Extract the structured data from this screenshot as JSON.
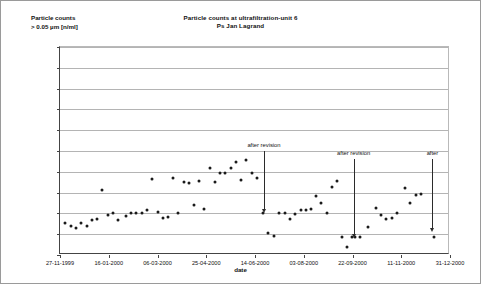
{
  "chart_data": {
    "type": "scatter",
    "title": "Particle counts at ultrafiltration-unit 6",
    "subtitle": "Ps Jan Lagrand",
    "ylabel_line1": "Particle counts",
    "ylabel_line2": "> 0.05 µm [n/ml]",
    "xlabel": "date",
    "ylim": [
      0,
      5000
    ],
    "ytick_labels": [
      "0",
      "500",
      "1,000",
      "1,500",
      "2,000",
      "2,500",
      "3,000",
      "3,500",
      "4,000",
      "4,500",
      "5,000"
    ],
    "ytick_values": [
      0,
      500,
      1000,
      1500,
      2000,
      2500,
      3000,
      3500,
      4000,
      4500,
      5000
    ],
    "xtick_labels": [
      "27-11-1999",
      "16-01-2000",
      "06-03-2000",
      "25-04-2000",
      "14-06-2000",
      "03-08-2000",
      "22-09-2000",
      "11-11-2000",
      "31-12-2000"
    ],
    "xtick_positions": [
      0,
      0.125,
      0.25,
      0.375,
      0.5,
      0.625,
      0.75,
      0.875,
      1.0
    ],
    "grid": true,
    "legend": null,
    "marker_color": "#1a1a1a",
    "series": [
      {
        "name": "particle counts",
        "points": [
          {
            "x": 0.012,
            "y": 760
          },
          {
            "x": 0.028,
            "y": 700
          },
          {
            "x": 0.041,
            "y": 640
          },
          {
            "x": 0.055,
            "y": 760
          },
          {
            "x": 0.069,
            "y": 690
          },
          {
            "x": 0.082,
            "y": 830
          },
          {
            "x": 0.095,
            "y": 860
          },
          {
            "x": 0.108,
            "y": 1570
          },
          {
            "x": 0.122,
            "y": 950
          },
          {
            "x": 0.135,
            "y": 1010
          },
          {
            "x": 0.149,
            "y": 830
          },
          {
            "x": 0.168,
            "y": 940
          },
          {
            "x": 0.183,
            "y": 1000
          },
          {
            "x": 0.196,
            "y": 1000
          },
          {
            "x": 0.21,
            "y": 1010
          },
          {
            "x": 0.223,
            "y": 1080
          },
          {
            "x": 0.237,
            "y": 1820
          },
          {
            "x": 0.25,
            "y": 1030
          },
          {
            "x": 0.263,
            "y": 900
          },
          {
            "x": 0.277,
            "y": 920
          },
          {
            "x": 0.29,
            "y": 1850
          },
          {
            "x": 0.303,
            "y": 1010
          },
          {
            "x": 0.317,
            "y": 1750
          },
          {
            "x": 0.33,
            "y": 1720
          },
          {
            "x": 0.343,
            "y": 1200
          },
          {
            "x": 0.357,
            "y": 1790
          },
          {
            "x": 0.37,
            "y": 1100
          },
          {
            "x": 0.384,
            "y": 2080
          },
          {
            "x": 0.398,
            "y": 1760
          },
          {
            "x": 0.411,
            "y": 1980
          },
          {
            "x": 0.424,
            "y": 1970
          },
          {
            "x": 0.438,
            "y": 2100
          },
          {
            "x": 0.451,
            "y": 2240
          },
          {
            "x": 0.464,
            "y": 1810
          },
          {
            "x": 0.478,
            "y": 2290
          },
          {
            "x": 0.492,
            "y": 1970
          },
          {
            "x": 0.505,
            "y": 1850
          },
          {
            "x": 0.52,
            "y": 1010
          },
          {
            "x": 0.534,
            "y": 530
          },
          {
            "x": 0.548,
            "y": 450
          },
          {
            "x": 0.562,
            "y": 1000
          },
          {
            "x": 0.576,
            "y": 1010
          },
          {
            "x": 0.59,
            "y": 860
          },
          {
            "x": 0.603,
            "y": 990
          },
          {
            "x": 0.617,
            "y": 1070
          },
          {
            "x": 0.63,
            "y": 1090
          },
          {
            "x": 0.644,
            "y": 1110
          },
          {
            "x": 0.657,
            "y": 1430
          },
          {
            "x": 0.67,
            "y": 1240
          },
          {
            "x": 0.684,
            "y": 1020
          },
          {
            "x": 0.697,
            "y": 1630
          },
          {
            "x": 0.711,
            "y": 1780
          },
          {
            "x": 0.722,
            "y": 440
          },
          {
            "x": 0.737,
            "y": 200
          },
          {
            "x": 0.748,
            "y": 440
          },
          {
            "x": 0.757,
            "y": 440
          },
          {
            "x": 0.77,
            "y": 430
          },
          {
            "x": 0.79,
            "y": 670
          },
          {
            "x": 0.81,
            "y": 1130
          },
          {
            "x": 0.824,
            "y": 960
          },
          {
            "x": 0.837,
            "y": 870
          },
          {
            "x": 0.85,
            "y": 890
          },
          {
            "x": 0.864,
            "y": 1000
          },
          {
            "x": 0.885,
            "y": 1620
          },
          {
            "x": 0.898,
            "y": 1260
          },
          {
            "x": 0.912,
            "y": 1440
          },
          {
            "x": 0.925,
            "y": 1470
          },
          {
            "x": 0.96,
            "y": 430
          }
        ]
      }
    ],
    "annotations": [
      {
        "label": "after revision",
        "x": 0.523,
        "y_top": 2500,
        "y_bottom": 1000
      },
      {
        "label": "after revision",
        "x": 0.753,
        "y_top": 2300,
        "y_bottom": 420
      },
      {
        "label": "after",
        "x": 0.955,
        "y_top": 2300,
        "y_bottom": 560
      }
    ]
  }
}
